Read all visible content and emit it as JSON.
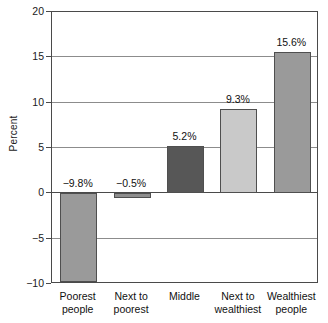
{
  "chart_data": {
    "type": "bar",
    "title": "",
    "subtitle": "",
    "xlabel": "",
    "ylabel": "Percent",
    "ylim": [
      -10,
      20
    ],
    "ytick_step": 5,
    "yticks": [
      20,
      15,
      10,
      5,
      0,
      -5,
      -10
    ],
    "ytick_labels": [
      "20",
      "15",
      "10",
      "5",
      "0",
      "-5",
      "-10"
    ],
    "grid": "horizontal",
    "legend": "none",
    "categories": [
      "Poorest people",
      "Next to poorest",
      "Middle",
      "Next to wealthiest",
      "Wealthiest people"
    ],
    "category_lines": [
      [
        "Poorest",
        "people"
      ],
      [
        "Next to",
        "poorest"
      ],
      [
        "Middle",
        ""
      ],
      [
        "Next to",
        "wealthiest"
      ],
      [
        "Wealthiest",
        "people"
      ]
    ],
    "values": [
      -9.8,
      -0.5,
      5.2,
      9.3,
      15.6
    ],
    "data_labels": [
      "−9.8%",
      "−0.5%",
      "5.2%",
      "9.3%",
      "15.6%"
    ],
    "bar_colors": [
      "#9a9a9a",
      "#8e8e8e",
      "#575757",
      "#c9c9c9",
      "#9a9a9a"
    ],
    "bar_edge_color": "#4f4f4f",
    "axis_color": "#4a4a4a",
    "grid_color": "#8c8c8c",
    "background_color": "#ffffff"
  }
}
